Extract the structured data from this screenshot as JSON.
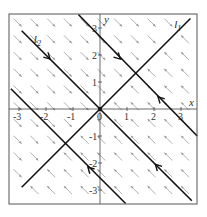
{
  "diagram": {
    "type": "phase-portrait",
    "frame": {
      "x0": 9,
      "y0": 14,
      "x1": 197,
      "y1": 204
    },
    "origin_px": {
      "x": 100,
      "y": 109
    },
    "unit_px": 27,
    "xrange": [
      -3.35,
      3.6
    ],
    "yrange": [
      -3.5,
      3.5
    ],
    "axes": {
      "x_label": "x",
      "y_label": "y",
      "x_ticks": [
        {
          "value": -3,
          "label": "-3"
        },
        {
          "value": -2,
          "label": "-2"
        },
        {
          "value": -1,
          "label": "-1"
        },
        {
          "value": 0,
          "label": "0"
        },
        {
          "value": 1,
          "label": "1"
        },
        {
          "value": 2,
          "label": "2"
        },
        {
          "value": 3,
          "label": "3"
        }
      ],
      "y_ticks": [
        {
          "value": 3,
          "label": "3"
        },
        {
          "value": 2,
          "label": "2"
        },
        {
          "value": 1,
          "label": "1"
        },
        {
          "value": -1,
          "label": "-1"
        },
        {
          "value": -2,
          "label": "-2"
        },
        {
          "value": -3,
          "label": "-3"
        }
      ]
    },
    "lines": [
      {
        "id": "l1",
        "label": "l",
        "subscript": "1",
        "equation": "y = x",
        "from": [
          -2.9,
          -2.9
        ],
        "to": [
          3.35,
          3.35
        ],
        "label_pos": [
          2.75,
          3.0
        ]
      },
      {
        "id": "l2",
        "label": "l",
        "subscript": "2",
        "equation": "y = -x",
        "from": [
          -2.9,
          2.9
        ],
        "to": [
          3.4,
          -3.4
        ],
        "label_pos": [
          -2.45,
          2.45
        ]
      },
      {
        "id": "upper-trajectory",
        "label": "",
        "equation": "x + y = 2.6",
        "from": [
          -0.8,
          3.5
        ],
        "to": [
          3.6,
          -1.0
        ]
      },
      {
        "id": "lower-trajectory",
        "label": "",
        "equation": "x + y = -2.6",
        "from": [
          -3.3,
          0.75
        ],
        "to": [
          0.95,
          -3.5
        ]
      }
    ],
    "trajectory_arrows": [
      {
        "at": [
          -1.85,
          1.85
        ],
        "direction": "down-right"
      },
      {
        "at": [
          2.05,
          -2.05
        ],
        "direction": "up-left"
      },
      {
        "at": [
          0.75,
          1.85
        ],
        "direction": "down-right"
      },
      {
        "at": [
          2.15,
          0.45
        ],
        "direction": "up-left"
      },
      {
        "at": [
          -0.45,
          -2.15
        ],
        "direction": "up-left"
      }
    ],
    "direction_field": {
      "spacing": 0.62,
      "arrow_length": 0.42,
      "rule": "points down-right above l1 (y > x), up-left below l1 (y < x)"
    },
    "colors": {
      "frame": "#555555",
      "axes": "#444444",
      "field": "#9a9a9a",
      "trajectories": "#111111",
      "background": "#ffffff"
    }
  }
}
